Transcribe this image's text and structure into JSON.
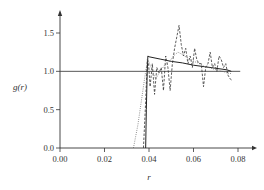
{
  "chart_data": {
    "type": "line",
    "title": "",
    "xlabel": "r",
    "ylabel": "g(r)",
    "xlim": [
      0.0,
      0.085
    ],
    "ylim": [
      0.0,
      1.8
    ],
    "xticks": [
      0.0,
      0.02,
      0.04,
      0.06,
      0.08
    ],
    "xtick_labels": [
      "0.00",
      "0.02",
      "0.04",
      "0.06",
      "0.08"
    ],
    "yticks": [
      0.0,
      0.5,
      1.0,
      1.5
    ],
    "ytick_labels": [
      "0.0",
      "0.5",
      "1.0",
      "1.5"
    ],
    "reference_line": {
      "y": 1.0,
      "x_range": [
        0.0,
        0.081
      ]
    },
    "grid": false,
    "legend": "none",
    "series": [
      {
        "name": "solid",
        "style": "solid",
        "color": "#222222",
        "x": [
          0.0385,
          0.0388,
          0.0392,
          0.0395,
          0.04,
          0.045,
          0.05,
          0.055,
          0.06,
          0.065,
          0.07,
          0.075,
          0.077
        ],
        "y": [
          0.0,
          0.5,
          1.0,
          1.2,
          1.19,
          1.16,
          1.13,
          1.11,
          1.08,
          1.06,
          1.04,
          1.02,
          1.0
        ]
      },
      {
        "name": "dashed",
        "style": "dashed",
        "color": "#333333",
        "x": [
          0.0375,
          0.0385,
          0.0392,
          0.0398,
          0.0405,
          0.0415,
          0.0425,
          0.0435,
          0.0445,
          0.0455,
          0.0465,
          0.0475,
          0.0485,
          0.0495,
          0.0505,
          0.0515,
          0.0525,
          0.0535,
          0.0545,
          0.0555,
          0.0565,
          0.0575,
          0.0585,
          0.0595,
          0.0605,
          0.0615,
          0.0625,
          0.0635,
          0.0645,
          0.0655,
          0.0665,
          0.0675,
          0.0685,
          0.0695,
          0.0705,
          0.0715,
          0.0725,
          0.0735,
          0.0745,
          0.0755,
          0.0765,
          0.0775
        ],
        "y": [
          0.0,
          0.6,
          1.15,
          1.1,
          0.8,
          1.1,
          0.7,
          1.05,
          0.98,
          1.05,
          0.75,
          1.2,
          1.05,
          0.75,
          1.1,
          1.3,
          1.45,
          1.6,
          1.35,
          1.2,
          1.3,
          1.1,
          1.2,
          1.05,
          1.3,
          1.15,
          1.1,
          1.1,
          0.8,
          1.05,
          1.1,
          1.25,
          1.05,
          1.1,
          1.0,
          1.2,
          1.15,
          1.05,
          1.1,
          0.95,
          0.9,
          0.88
        ]
      },
      {
        "name": "dotted",
        "style": "dotted",
        "color": "#555555",
        "x": [
          0.033,
          0.035,
          0.037,
          0.0385,
          0.0395,
          0.041,
          0.043,
          0.045,
          0.047,
          0.049,
          0.051,
          0.053,
          0.055,
          0.057,
          0.059,
          0.061,
          0.063,
          0.065,
          0.067,
          0.069,
          0.071,
          0.073,
          0.075,
          0.077
        ],
        "y": [
          0.0,
          0.3,
          0.7,
          1.0,
          1.15,
          1.05,
          0.9,
          1.0,
          1.08,
          1.12,
          1.2,
          1.25,
          1.22,
          1.18,
          1.15,
          1.12,
          1.1,
          1.06,
          1.05,
          1.03,
          1.02,
          1.0,
          0.98,
          0.97
        ]
      }
    ]
  }
}
